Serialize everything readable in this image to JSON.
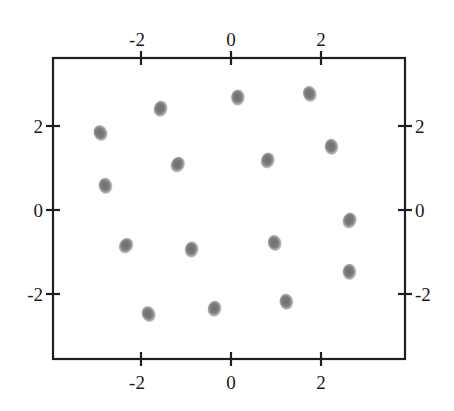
{
  "chart_data": {
    "type": "scatter",
    "title": "",
    "xlabel": "",
    "ylabel": "",
    "xlim": [
      -3.9,
      3.9
    ],
    "ylim": [
      -3.6,
      3.6
    ],
    "grid": false,
    "legend": null,
    "axes_on_all_sides": true,
    "x_ticks": [
      -2,
      0,
      2
    ],
    "y_ticks": [
      -2,
      0,
      2
    ],
    "x_tick_labels": [
      "-2",
      "0",
      "2"
    ],
    "y_tick_labels": [
      "-2",
      "0",
      "2"
    ],
    "marker": {
      "shape": "soft-blob",
      "color": "#7a7a7a",
      "size_px": 15
    },
    "points": [
      {
        "x": -2.89,
        "y": 1.83
      },
      {
        "x": -1.56,
        "y": 2.4
      },
      {
        "x": -2.78,
        "y": 0.57
      },
      {
        "x": -1.18,
        "y": 1.07
      },
      {
        "x": 0.16,
        "y": 2.67
      },
      {
        "x": 1.76,
        "y": 2.76
      },
      {
        "x": 0.82,
        "y": 1.17
      },
      {
        "x": 2.24,
        "y": 1.5
      },
      {
        "x": -2.33,
        "y": -0.86
      },
      {
        "x": -0.87,
        "y": -0.95
      },
      {
        "x": 0.98,
        "y": -0.79
      },
      {
        "x": 2.64,
        "y": -0.26
      },
      {
        "x": 2.64,
        "y": -1.48
      },
      {
        "x": -1.82,
        "y": -2.48
      },
      {
        "x": -0.36,
        "y": -2.36
      },
      {
        "x": 1.24,
        "y": -2.19
      }
    ]
  },
  "plot": {
    "frame_px": {
      "left": 53,
      "right": 405,
      "top": 58,
      "bottom": 359
    },
    "origin_px": {
      "x": 231,
      "y": 210
    },
    "unit_px": {
      "x": 45,
      "y": 42
    }
  }
}
